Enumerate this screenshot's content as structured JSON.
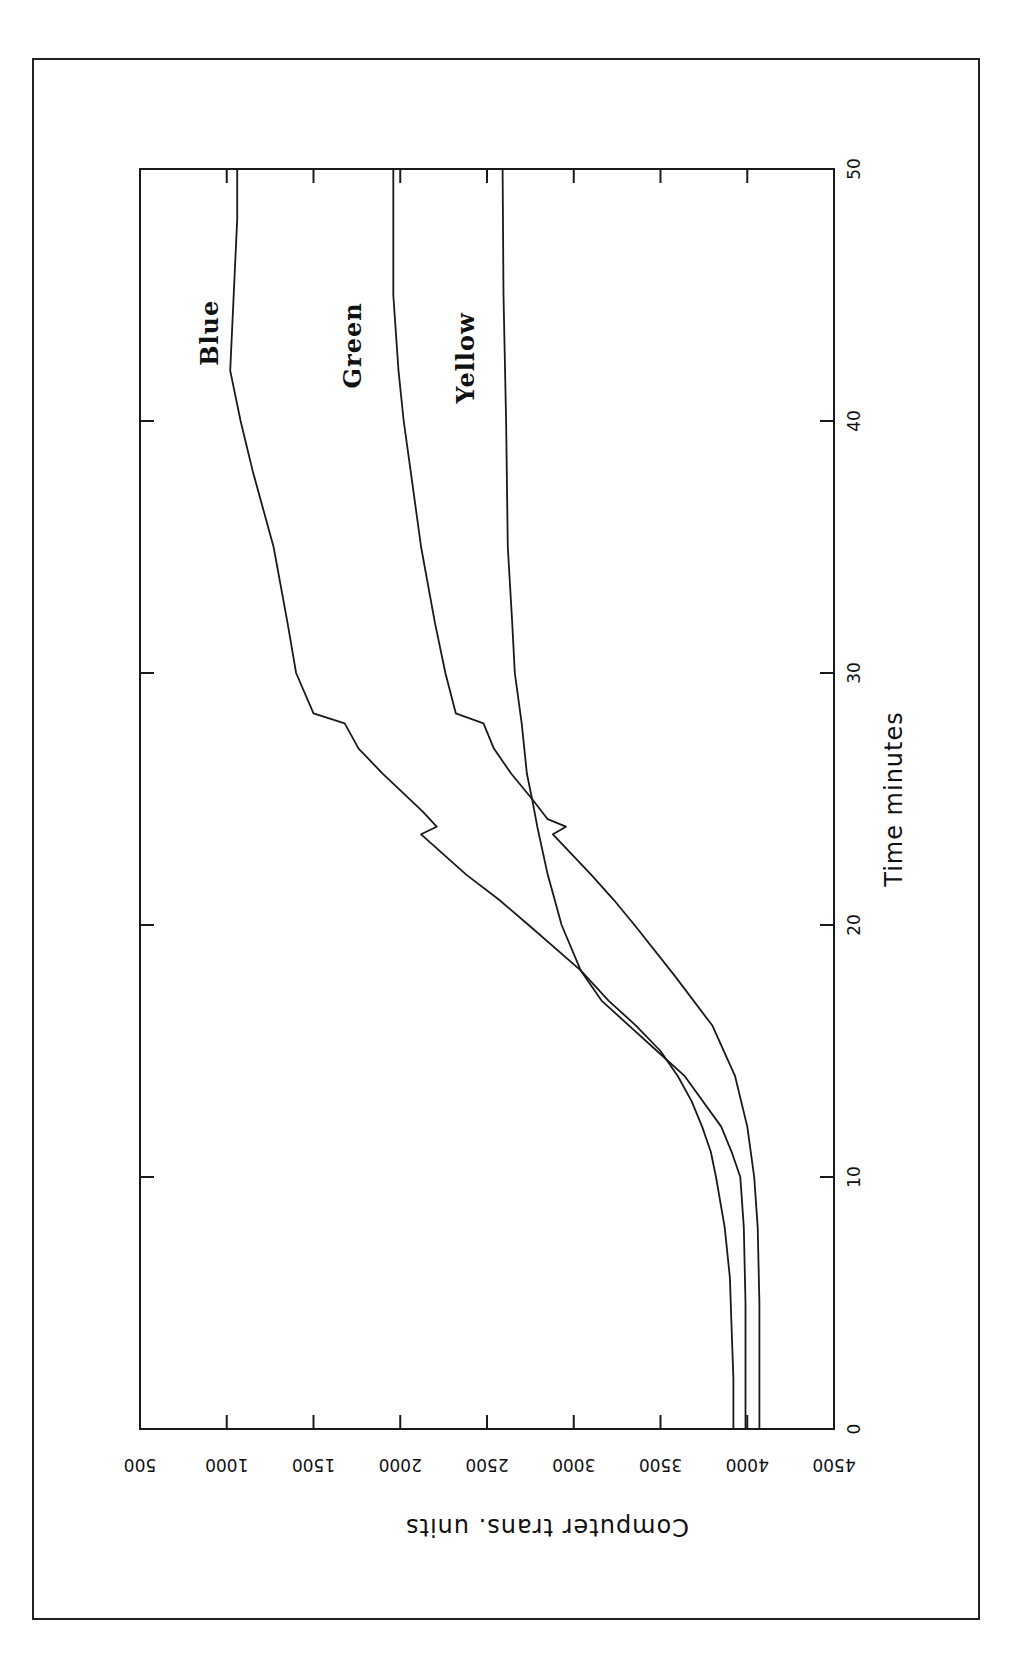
{
  "chart_data": {
    "type": "line",
    "title": "",
    "orientation_note": "figure rotated 90 degrees clockwise on page",
    "xlabel": "Time minutes",
    "ylabel": "Computer trans. units",
    "xlim": [
      0,
      50
    ],
    "ylim": [
      4500,
      500
    ],
    "xticks": [
      0,
      10,
      20,
      30,
      40,
      50
    ],
    "yticks": [
      4500,
      4000,
      3500,
      3000,
      2500,
      2000,
      1500,
      1000,
      500
    ],
    "grid": false,
    "legend": "inline labels near curve ends",
    "series": [
      {
        "name": "Blue",
        "points": [
          [
            0,
            3990
          ],
          [
            2,
            3990
          ],
          [
            5,
            3990
          ],
          [
            8,
            3980
          ],
          [
            10,
            3960
          ],
          [
            11,
            3910
          ],
          [
            12,
            3850
          ],
          [
            14,
            3640
          ],
          [
            15,
            3480
          ],
          [
            16,
            3320
          ],
          [
            17,
            3160
          ],
          [
            18.2,
            3040
          ],
          [
            20,
            2740
          ],
          [
            21,
            2570
          ],
          [
            22,
            2380
          ],
          [
            23.6,
            2120
          ],
          [
            23.9,
            2210
          ],
          [
            24.5,
            2130
          ],
          [
            26,
            1900
          ],
          [
            27,
            1760
          ],
          [
            28,
            1680
          ],
          [
            28.4,
            1500
          ],
          [
            30,
            1400
          ],
          [
            32,
            1350
          ],
          [
            35,
            1270
          ],
          [
            38,
            1150
          ],
          [
            40,
            1080
          ],
          [
            42,
            1020
          ],
          [
            45,
            1040
          ],
          [
            48,
            1060
          ],
          [
            50,
            1060
          ]
        ]
      },
      {
        "name": "Green",
        "points": [
          [
            0,
            4070
          ],
          [
            2,
            4070
          ],
          [
            5,
            4070
          ],
          [
            8,
            4060
          ],
          [
            10,
            4040
          ],
          [
            12,
            4000
          ],
          [
            14,
            3930
          ],
          [
            16,
            3800
          ],
          [
            18,
            3580
          ],
          [
            20,
            3350
          ],
          [
            21,
            3230
          ],
          [
            22,
            3100
          ],
          [
            23.6,
            2880
          ],
          [
            23.9,
            2955
          ],
          [
            24.2,
            2850
          ],
          [
            25,
            2760
          ],
          [
            26,
            2640
          ],
          [
            27,
            2540
          ],
          [
            28,
            2480
          ],
          [
            28.4,
            2320
          ],
          [
            30,
            2260
          ],
          [
            32,
            2200
          ],
          [
            35,
            2120
          ],
          [
            38,
            2060
          ],
          [
            40,
            2020
          ],
          [
            42,
            1990
          ],
          [
            45,
            1960
          ],
          [
            50,
            1960
          ]
        ]
      },
      {
        "name": "Yellow",
        "points": [
          [
            0,
            3920
          ],
          [
            2,
            3920
          ],
          [
            4,
            3910
          ],
          [
            6,
            3900
          ],
          [
            8,
            3870
          ],
          [
            10,
            3820
          ],
          [
            11,
            3790
          ],
          [
            12,
            3740
          ],
          [
            13,
            3680
          ],
          [
            14,
            3600
          ],
          [
            15,
            3500
          ],
          [
            16,
            3360
          ],
          [
            17,
            3200
          ],
          [
            18.2,
            3040
          ],
          [
            20,
            2930
          ],
          [
            21,
            2890
          ],
          [
            22,
            2850
          ],
          [
            23.9,
            2790
          ],
          [
            25,
            2760
          ],
          [
            26,
            2730
          ],
          [
            28,
            2700
          ],
          [
            30,
            2660
          ],
          [
            32,
            2645
          ],
          [
            35,
            2620
          ],
          [
            40,
            2610
          ],
          [
            45,
            2595
          ],
          [
            50,
            2590
          ]
        ]
      }
    ]
  },
  "labels": {
    "x_axis": "Time minutes",
    "y_axis": "Computer trans. units",
    "x_ticks": [
      "0",
      "10",
      "20",
      "30",
      "40",
      "50"
    ],
    "y_ticks": [
      "4500",
      "4000",
      "3500",
      "3000",
      "2500",
      "2000",
      "1500",
      "1000",
      "500"
    ],
    "series": [
      "Blue",
      "Green",
      "Yellow"
    ]
  }
}
